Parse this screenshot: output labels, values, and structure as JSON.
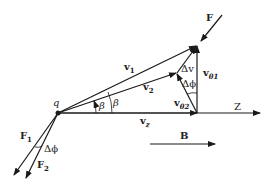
{
  "diagram": {
    "labels": {
      "charge": "q",
      "force_top": "F",
      "v1": "v",
      "v1_sub": "1",
      "v2": "v",
      "v2_sub": "2",
      "vz": "v",
      "vz_sub": "z",
      "delta_v": "Δv",
      "delta_phi_top": "Δϕ",
      "v_theta1": "v",
      "v_theta1_sub": "θ1",
      "v_theta2": "v",
      "v_theta2_sub": "θ2",
      "beta_inner": "β",
      "beta_outer": "β",
      "z_axis": "Z",
      "field": "B",
      "F1": "F",
      "F1_sub": "1",
      "F2": "F",
      "F2_sub": "2",
      "delta_phi_bottom": "Δϕ"
    },
    "colors": {
      "stroke": "#1a1a1a",
      "background": "#ffffff"
    }
  }
}
